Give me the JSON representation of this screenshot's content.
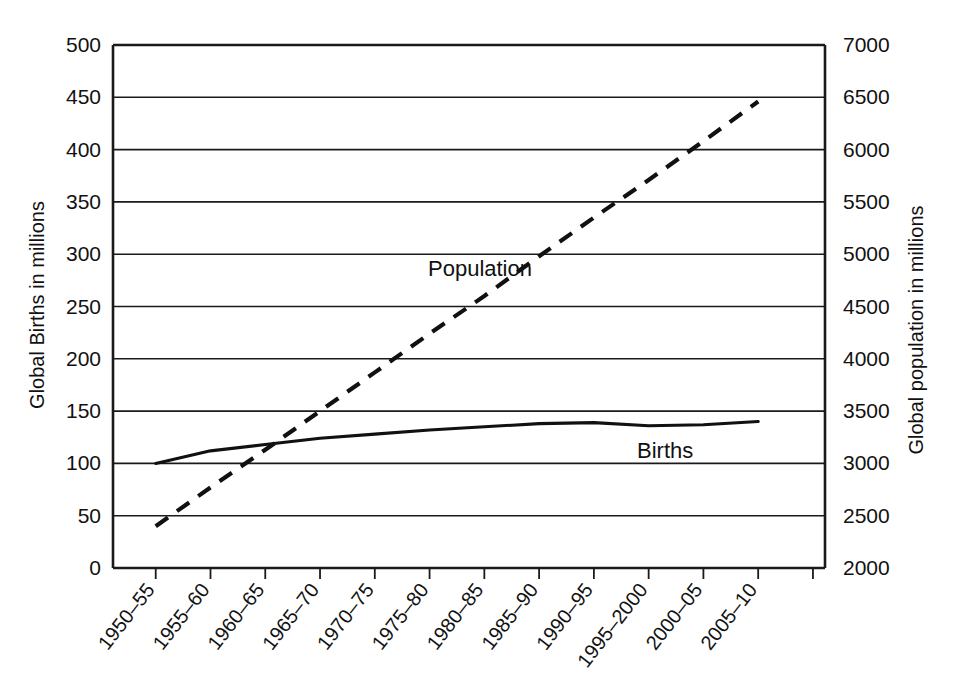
{
  "chart_data": {
    "type": "line",
    "title": "",
    "subtitle": "",
    "xlabel": "",
    "ylabel": "Global Births in millions",
    "y2label": "Global population in millions",
    "grid": true,
    "legend": "inline-annotations",
    "categories": [
      "1950–55",
      "1955–60",
      "1960–65",
      "1965–70",
      "1970–75",
      "1975–80",
      "1980–85",
      "1985–90",
      "1990–95",
      "1995–2000",
      "2000–05",
      "2005–10"
    ],
    "ylim": [
      0,
      500
    ],
    "yticks": [
      0,
      50,
      100,
      150,
      200,
      250,
      300,
      350,
      400,
      450,
      500
    ],
    "ytick_labels": [
      "0",
      "50",
      "100",
      "150",
      "200",
      "250",
      "300",
      "350",
      "400",
      "450",
      "500"
    ],
    "y2lim": [
      2000,
      7000
    ],
    "y2ticks": [
      2000,
      2500,
      3000,
      3500,
      4000,
      4500,
      5000,
      5500,
      6000,
      6500,
      7000
    ],
    "y2tick_labels": [
      "2000",
      "2500",
      "3000",
      "3500",
      "4000",
      "4500",
      "5000",
      "5500",
      "6000",
      "6500",
      "7000"
    ],
    "series": [
      {
        "name": "Births",
        "axis": "left",
        "style": "solid",
        "label_text": "Births",
        "values": [
          100,
          112,
          118,
          124,
          128,
          132,
          135,
          138,
          139,
          136,
          137,
          140
        ]
      },
      {
        "name": "Population",
        "axis": "right",
        "style": "dashed",
        "label_text": "Population",
        "values": [
          2400,
          2770,
          3130,
          3500,
          3870,
          4240,
          4600,
          4980,
          5350,
          5710,
          6080,
          6460
        ]
      }
    ],
    "annotations": [
      {
        "text": "Population",
        "series": "Population"
      },
      {
        "text": "Births",
        "series": "Births"
      }
    ],
    "colors": {
      "axis": "#1a1a1a",
      "grid": "#1a1a1a",
      "births_line": "#111111",
      "population_line": "#111111",
      "background": "#ffffff"
    }
  }
}
